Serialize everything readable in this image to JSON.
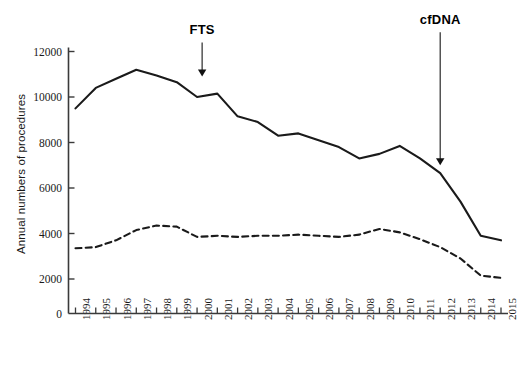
{
  "chart_data": {
    "type": "line",
    "title": "",
    "xlabel": "",
    "ylabel": "Annual numbers of procedures",
    "x": [
      1994,
      1995,
      1996,
      1997,
      1998,
      1999,
      2000,
      2001,
      2002,
      2003,
      2004,
      2005,
      2006,
      2007,
      2008,
      2009,
      2010,
      2011,
      2012,
      2013,
      2014,
      2015
    ],
    "xtick_labels": [
      "1994",
      "1995",
      "1996",
      "1997",
      "1998",
      "1999",
      "2000",
      "2001",
      "2002",
      "2003",
      "2004",
      "2005",
      "2006",
      "2007",
      "2008",
      "2009",
      "2010",
      "2011",
      "2012",
      "2013",
      "2014",
      "2015"
    ],
    "ytick_labels": [
      "0",
      "2000",
      "4000",
      "6000",
      "8000",
      "10000",
      "12000"
    ],
    "yticks": [
      0,
      2000,
      4000,
      6000,
      8000,
      10000,
      12000
    ],
    "ylim": [
      0,
      12400
    ],
    "xlim": [
      1994,
      2015
    ],
    "grid": false,
    "legend": "none",
    "series": [
      {
        "name": "solid-series",
        "style": "solid",
        "color": "#1a1a1a",
        "values": [
          9500,
          10400,
          10800,
          11200,
          10950,
          10650,
          10000,
          10150,
          9150,
          8900,
          8300,
          8400,
          8100,
          7800,
          7300,
          7500,
          7850,
          7300,
          6650,
          5400,
          3900,
          3700
        ]
      },
      {
        "name": "dashed-series",
        "style": "dashed",
        "color": "#1a1a1a",
        "values": [
          3350,
          3400,
          3700,
          4150,
          4350,
          4300,
          3850,
          3900,
          3850,
          3900,
          3900,
          3950,
          3900,
          3850,
          3950,
          4200,
          4050,
          3750,
          3400,
          2900,
          2150,
          2050
        ]
      }
    ],
    "annotations": [
      {
        "label": "FTS",
        "x": 2000.25,
        "arrow_from_y": 12400,
        "arrow_to_y": 10900
      },
      {
        "label": "cfDNA",
        "x": 2012.0,
        "arrow_from_y": 12850,
        "arrow_to_y": 7000
      }
    ]
  }
}
